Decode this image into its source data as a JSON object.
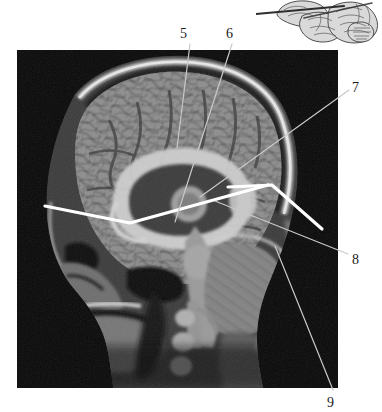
{
  "figure": {
    "type": "anatomical-figure",
    "modality": "MRI",
    "view": "midsagittal-section-of-head",
    "panel": {
      "name": "sagittal-mri-image",
      "left": 17,
      "top": 50,
      "width": 321,
      "height": 338,
      "background_color": "#0a0a0a"
    },
    "inset": {
      "name": "brain-orientation-inset",
      "description": "line drawing of brain with section plane line",
      "line_color": "#3a3a3a",
      "fill_color": "#d8d8d8"
    },
    "callouts": [
      {
        "id": "5",
        "label": "5",
        "label_x": 180,
        "label_y": 27,
        "leader": {
          "x1": 190,
          "y1": 44,
          "x2": 177,
          "y2": 148
        },
        "leader_color": "#c9c9c9",
        "points_to": "corpus-callosum-body"
      },
      {
        "id": "6",
        "label": "6",
        "label_x": 226,
        "label_y": 27,
        "leader": {
          "x1": 232,
          "y1": 44,
          "x2": 175,
          "y2": 222
        },
        "leader_color": "#c9c9c9",
        "points_to": "thalamus-midbrain"
      },
      {
        "id": "7",
        "label": "7",
        "label_x": 352,
        "label_y": 81,
        "leader": {
          "x1": 349,
          "y1": 90,
          "x2": 200,
          "y2": 197
        },
        "leader_color": "#c9c9c9",
        "points_to": "parieto-occipital-region"
      },
      {
        "id": "8",
        "label": "8",
        "label_x": 352,
        "label_y": 253,
        "leader": {
          "x1": 348,
          "y1": 254,
          "x2": 215,
          "y2": 201
        },
        "leader_color": "#c9c9c9",
        "points_to": "tentorium-cerebelli-region"
      },
      {
        "id": "9",
        "label": "9",
        "label_x": 327,
        "label_y": 396,
        "leader": {
          "x1": 333,
          "y1": 390,
          "x2": 275,
          "y2": 246
        },
        "leader_color": "#c9c9c9",
        "points_to": "cerebellum"
      }
    ],
    "markers": {
      "name": "white-measurement-lines",
      "color": "#ffffff",
      "stroke_width": 3.2,
      "polylines": [
        [
          [
            45,
            206
          ],
          [
            130,
            223
          ],
          [
            268,
            185
          ]
        ],
        [
          [
            228,
            187
          ],
          [
            272,
            185
          ],
          [
            322,
            229
          ]
        ]
      ]
    }
  }
}
